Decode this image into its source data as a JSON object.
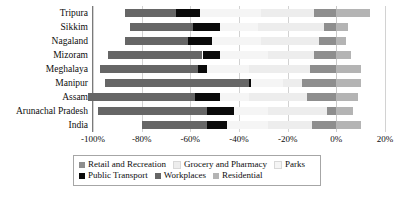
{
  "chart_data": {
    "type": "bar",
    "orientation": "horizontal",
    "stacked": true,
    "title": "",
    "xlabel": "",
    "ylabel": "",
    "xlim": [
      -100,
      20
    ],
    "grid": true,
    "legend_position": "bottom",
    "tick_labels": [
      "-100%",
      "-80%",
      "-60%",
      "-40%",
      "-20%",
      "0%",
      "20%"
    ],
    "tick_values": [
      -100,
      -80,
      -60,
      -40,
      -20,
      0,
      20
    ],
    "categories": [
      "Tripura",
      "Sikkim",
      "Nagaland",
      "Mizoram",
      "Meghalaya",
      "Manipur",
      "Assam",
      "Arunachal Pradesh",
      "India"
    ],
    "series": [
      {
        "name": "Retail and Recreation",
        "color": "#8e8e8e",
        "values": [
          -9,
          -5,
          -7,
          -9,
          -11,
          -14,
          -12,
          -4,
          -10
        ]
      },
      {
        "name": "Grocery and Pharmacy",
        "color": "#ededed",
        "values": [
          -22,
          -27,
          -24,
          -19,
          -25,
          -8,
          -24,
          -24,
          -18
        ]
      },
      {
        "name": "Parks",
        "color": "#f5f5f5",
        "values": [
          -25,
          -16,
          -20,
          -20,
          -17,
          -13,
          -12,
          -14,
          -17
        ]
      },
      {
        "name": "Public Transport",
        "color": "#0a0a0a",
        "values": [
          -10,
          -11,
          -10,
          -7,
          -4,
          -1,
          -10,
          -11,
          -8
        ]
      },
      {
        "name": "Workplaces",
        "color": "#666666",
        "values": [
          -21,
          -26,
          -26,
          -39,
          -40,
          -59,
          -44,
          -45,
          -27
        ]
      },
      {
        "name": "Residential",
        "color": "#b4b4b4",
        "values": [
          14,
          5,
          4,
          6,
          10,
          10,
          9,
          7,
          10
        ]
      }
    ]
  },
  "legend": {
    "items": [
      {
        "label": "Retail and Recreation",
        "color": "#8e8e8e"
      },
      {
        "label": "Grocery and Pharmacy",
        "color": "#ededed"
      },
      {
        "label": "Parks",
        "color": "#f5f5f5"
      },
      {
        "label": "Public Transport",
        "color": "#0a0a0a"
      },
      {
        "label": "Workplaces",
        "color": "#666666"
      },
      {
        "label": "Residential",
        "color": "#b4b4b4"
      }
    ],
    "row_split": 3
  }
}
